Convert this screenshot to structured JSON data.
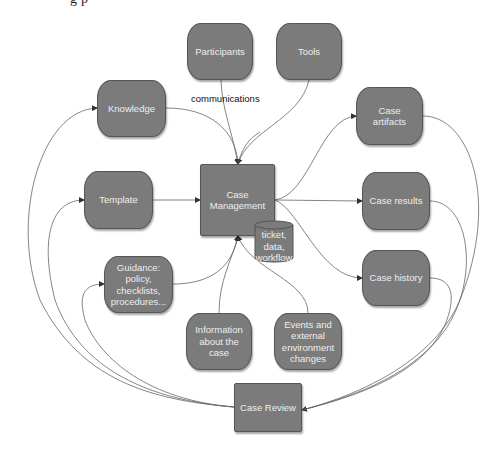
{
  "top_clipped_text": "g     p",
  "nodes": {
    "participants": {
      "label": "Participants"
    },
    "tools": {
      "label": "Tools"
    },
    "knowledge": {
      "label": "Knowledge"
    },
    "case_artifacts": {
      "label": "Case artifacts"
    },
    "template": {
      "label": "Template"
    },
    "case_management": {
      "label": "Case Management"
    },
    "case_results": {
      "label": "Case results"
    },
    "datastore": {
      "label": "ticket, data, workflow"
    },
    "guidance": {
      "label": "Guidance: policy, checklists, procedures..."
    },
    "case_history": {
      "label": "Case history"
    },
    "information": {
      "label": "Information about the case"
    },
    "events": {
      "label": "Events and external environment changes"
    },
    "case_review": {
      "label": "Case Review"
    }
  },
  "edge_labels": {
    "communications": "communications"
  },
  "edges": [
    {
      "from": "Participants",
      "to": "Case Management"
    },
    {
      "from": "Tools",
      "to": "Case Management"
    },
    {
      "from": "Knowledge",
      "to": "Case Management"
    },
    {
      "from": "Template",
      "to": "Case Management"
    },
    {
      "from": "Guidance: policy, checklists, procedures...",
      "to": "Case Management"
    },
    {
      "from": "Information about the case",
      "to": "Case Management"
    },
    {
      "from": "Events and external environment changes",
      "to": "Case Management"
    },
    {
      "from": "Case Management",
      "to": "Case artifacts"
    },
    {
      "from": "Case Management",
      "to": "Case results"
    },
    {
      "from": "Case Management",
      "to": "Case history"
    },
    {
      "from": "Case artifacts",
      "to": "Case Review"
    },
    {
      "from": "Case results",
      "to": "Case Review"
    },
    {
      "from": "Case history",
      "to": "Case Review"
    },
    {
      "from": "Case Review",
      "to": "Knowledge"
    },
    {
      "from": "Case Review",
      "to": "Template"
    },
    {
      "from": "Case Review",
      "to": "Guidance: policy, checklists, procedures..."
    }
  ],
  "colors": {
    "node_fill": "#7b7b7b",
    "node_text": "#eeeeee",
    "edge": "#555555",
    "background": "#ffffff"
  }
}
